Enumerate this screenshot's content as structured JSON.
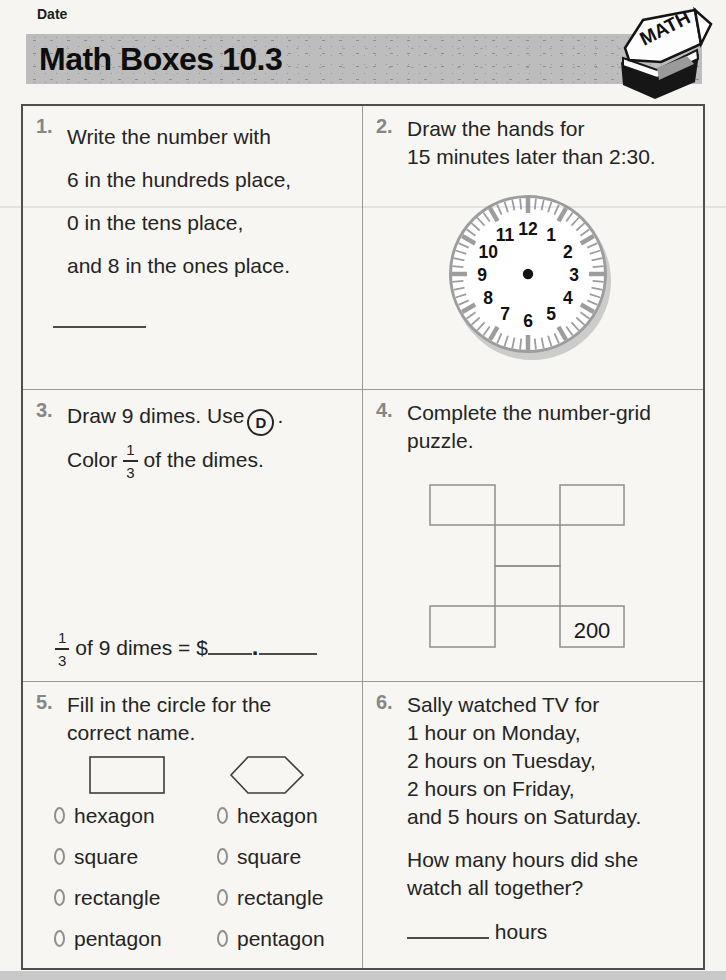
{
  "page": {
    "date_label": "Date",
    "title": "Math Boxes 10.3",
    "journal_icon_text": "MATH"
  },
  "colors": {
    "band_gray": "#bdbdbd",
    "clock_gray": "#9d9d9d",
    "grid_line_gray": "#9a9a9a",
    "number_bullet_gray": "#868686",
    "text": "#242424"
  },
  "box1": {
    "number": "1.",
    "lines": [
      "Write the number with",
      "6 in the hundreds place,",
      "0 in the tens place,",
      "and 8 in the ones place."
    ]
  },
  "box2": {
    "number": "2.",
    "lines": [
      "Draw the hands for",
      "15 minutes later than 2:30."
    ],
    "clock_numbers": [
      "12",
      "1",
      "2",
      "3",
      "4",
      "5",
      "6",
      "7",
      "8",
      "9",
      "10",
      "11"
    ]
  },
  "box3": {
    "number": "3.",
    "sentence1_pre": "Draw 9 dimes. Use",
    "d_symbol": "D",
    "sentence1_post": ".",
    "sentence2_pre": "Color",
    "fraction_numerator": "1",
    "fraction_denominator": "3",
    "sentence2_post": "of the dimes.",
    "answer_pre": "of 9 dimes = $",
    "answer_dot": "."
  },
  "box4": {
    "number": "4.",
    "lines": [
      "Complete the number-grid",
      "puzzle."
    ],
    "grid_value": "200"
  },
  "box5": {
    "number": "5.",
    "lines": [
      "Fill in the circle for the",
      "correct name."
    ],
    "left_options": [
      "hexagon",
      "square",
      "rectangle",
      "pentagon"
    ],
    "right_options": [
      "hexagon",
      "square",
      "rectangle",
      "pentagon"
    ]
  },
  "box6": {
    "number": "6.",
    "lines": [
      "Sally watched TV for",
      "1 hour on Monday,",
      "2 hours on Tuesday,",
      "2 hours on Friday,",
      "and 5 hours on Saturday."
    ],
    "question_lines": [
      "How many hours did she",
      "watch all together?"
    ],
    "answer_suffix": "hours"
  }
}
